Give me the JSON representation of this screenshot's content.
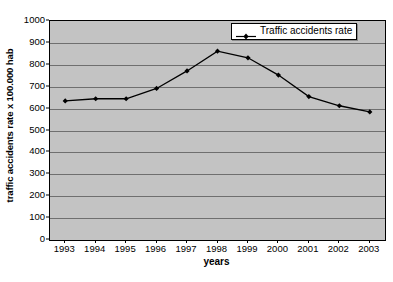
{
  "chart_data": {
    "type": "line",
    "title": "",
    "xlabel": "years",
    "ylabel": "traffic accidents rate x 100.000 hab",
    "categories": [
      "1993",
      "1994",
      "1995",
      "1996",
      "1997",
      "1998",
      "1999",
      "2000",
      "2001",
      "2002",
      "2003"
    ],
    "series": [
      {
        "name": "Traffic accidents rate",
        "values": [
          635,
          645,
          645,
          692,
          772,
          862,
          832,
          753,
          655,
          613,
          585
        ]
      }
    ],
    "ylim": [
      0,
      1000
    ],
    "ytick_step": 100,
    "yticks": [
      "0",
      "100",
      "200",
      "300",
      "400",
      "500",
      "600",
      "700",
      "800",
      "900",
      "1000"
    ],
    "grid": "horizontal",
    "legend_position": "top-right",
    "colors": {
      "plot_background": "#c3c3c3",
      "gridline": "#6f6f6f",
      "series_line": "#000000",
      "marker": "#000000",
      "axis": "#000000",
      "page_background": "#ffffff"
    }
  },
  "legend": {
    "entries": [
      {
        "label": "Traffic accidents rate",
        "symbol": "line-marker-icon"
      }
    ]
  },
  "axes": {
    "y_title": "traffic accidents rate x 100.000 hab",
    "x_title": "years"
  }
}
